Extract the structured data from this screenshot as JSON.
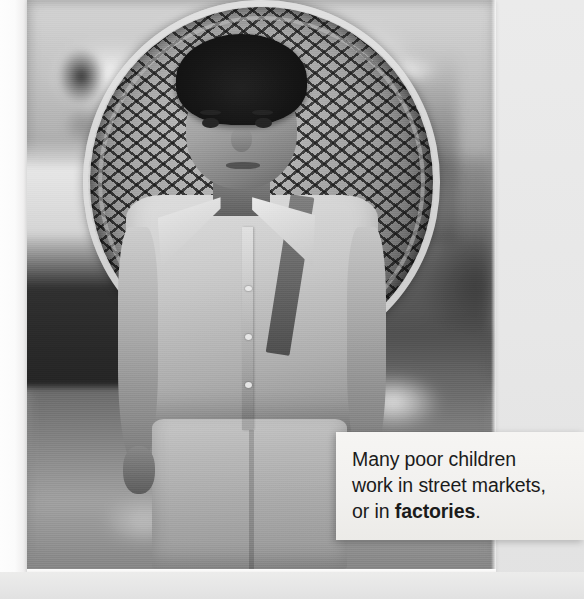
{
  "page": {
    "background_color": "#e9e9e9",
    "width": 584,
    "height": 599
  },
  "photo": {
    "alt": "Black and white photograph of a boy carrying a large woven basket on his back in a street market",
    "style": "black-and-white",
    "subject": "boy-with-basket",
    "frame_color": "#fbfbfa"
  },
  "caption": {
    "background_color": "#f2f1ef",
    "text_color": "#1b1b1b",
    "line1": "Many poor children",
    "line2": "work in street markets,",
    "line3_prefix": "or in ",
    "line3_bold": "factories",
    "line3_suffix": "."
  }
}
